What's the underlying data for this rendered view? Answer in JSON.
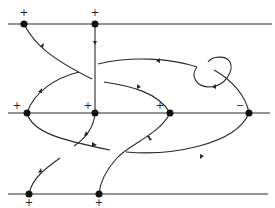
{
  "diagram": {
    "type": "knot-braid-diagram",
    "horizontal_lines": [
      {
        "name": "top",
        "y": 24
      },
      {
        "name": "middle",
        "y": 113
      },
      {
        "name": "bottom",
        "y": 194
      }
    ],
    "nodes": [
      {
        "id": "t1",
        "x": 24,
        "y": 24,
        "sign": "+",
        "sign_pos": "above"
      },
      {
        "id": "t2",
        "x": 95,
        "y": 24,
        "sign": "+",
        "sign_pos": "above"
      },
      {
        "id": "m1",
        "x": 27,
        "y": 113,
        "sign": "+",
        "sign_pos": "above-left"
      },
      {
        "id": "m2",
        "x": 95,
        "y": 113,
        "sign": "+",
        "sign_pos": "above-left"
      },
      {
        "id": "m3",
        "x": 170,
        "y": 113,
        "sign": "+",
        "sign_pos": "above-left"
      },
      {
        "id": "m4",
        "x": 249,
        "y": 113,
        "sign": "−",
        "sign_pos": "above-left"
      },
      {
        "id": "b1",
        "x": 29,
        "y": 194,
        "sign": "+",
        "sign_pos": "below"
      },
      {
        "id": "b2",
        "x": 99,
        "y": 194,
        "sign": "+",
        "sign_pos": "below"
      }
    ],
    "labels": {
      "t1": "+",
      "t2": "+",
      "m1": "+",
      "m2": "+",
      "m3": "+",
      "m4": "−",
      "b1": "+",
      "b2": "+"
    },
    "colors": {
      "stroke": "#2a2a2a",
      "node": "#111111",
      "background": "#ffffff"
    }
  }
}
